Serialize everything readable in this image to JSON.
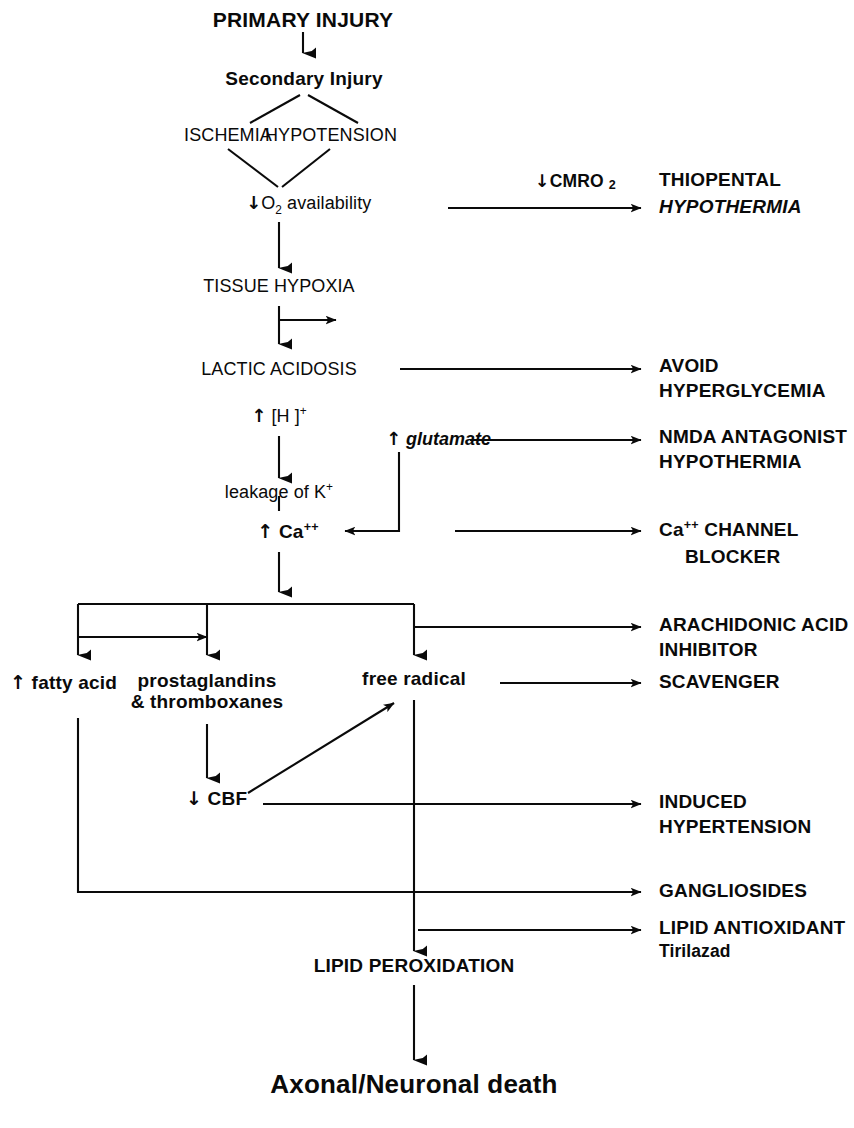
{
  "diagram": {
    "ink_color": "#0a0a0a",
    "background": "#ffffff"
  },
  "cascade": {
    "primary_injury": "PRIMARY INJURY",
    "secondary_injury": "Secondary Injury",
    "ischemia": "ISCHEMIA",
    "hypotension": "HYPOTENSION",
    "o2_availability_arrow": "↓",
    "o2_availability_text_a": "O",
    "o2_availability_sub": "2",
    "o2_availability_text_b": " availability",
    "tissue_hypoxia": "TISSUE HYPOXIA",
    "lactic_acidosis": "LACTIC ACIDOSIS",
    "h_ion_arrow": "↑",
    "h_ion_text": " [H ]",
    "h_ion_sup": "+",
    "glutamate_arrow": "↑",
    "glutamate_text": " glutamate",
    "leakage_text": "leakage of K",
    "leakage_sup": "+",
    "calcium_arrow": "↑",
    "calcium_text": " Ca",
    "calcium_sup": "++",
    "fatty_acid_arrow": "↑",
    "fatty_acid_text": " fatty acid",
    "prostaglandins_line1": "prostaglandins",
    "prostaglandins_line2": "& thromboxanes",
    "free_radical": "free radical",
    "cbf_arrow": "↓",
    "cbf_text": " CBF",
    "lipid_peroxidation": "LIPID PEROXIDATION",
    "axonal_neuronal_death": "Axonal/Neuronal death"
  },
  "interventions": {
    "cmro2_arrow": "↓",
    "cmro2_label": "CMRO",
    "cmro2_sub": "2",
    "thiopental": "THIOPENTAL",
    "hypothermia_1": "HYPOTHERMIA",
    "avoid": "AVOID",
    "hyperglycemia": "HYPERGLYCEMIA",
    "nmda_antagonist": "NMDA ANTAGONIST",
    "hypothermia_2": "HYPOTHERMIA",
    "ca_channel_prefix": "Ca",
    "ca_channel_sup": "++",
    "ca_channel_word": " CHANNEL",
    "ca_channel_blocker": "BLOCKER",
    "arachidonic_acid": "ARACHIDONIC ACID",
    "inhibitor": "INHIBITOR",
    "scavenger": "SCAVENGER",
    "induced": "INDUCED",
    "hypertension": "HYPERTENSION",
    "gangliosides": "GANGLIOSIDES",
    "lipid_antioxidant": "LIPID ANTIOXIDANT",
    "tirilazad": "Tirilazad"
  }
}
